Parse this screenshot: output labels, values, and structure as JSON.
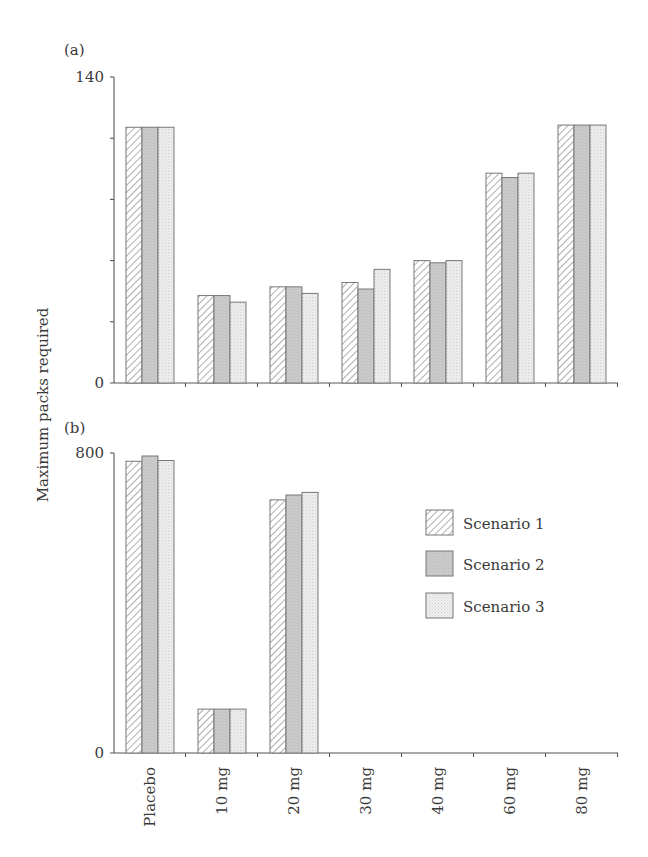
{
  "chart_data": [
    {
      "panel": "(a)",
      "type": "bar",
      "title": "",
      "xlabel": "",
      "ylabel": "Maximum packs required",
      "ylim": [
        0,
        140
      ],
      "yticks": [
        0,
        28,
        56,
        84,
        112,
        140
      ],
      "ytick_labels": [
        "0",
        "",
        "",
        "",
        "",
        "140"
      ],
      "grid": false,
      "categories": [
        "Placebo",
        "10 mg",
        "20 mg",
        "30 mg",
        "40 mg",
        "60 mg",
        "80 mg"
      ],
      "series": [
        {
          "name": "Scenario 1",
          "values": [
            117,
            40,
            44,
            46,
            56,
            96,
            118
          ]
        },
        {
          "name": "Scenario 2",
          "values": [
            117,
            40,
            44,
            43,
            55,
            94,
            118
          ]
        },
        {
          "name": "Scenario 3",
          "values": [
            117,
            37,
            41,
            52,
            56,
            96,
            118
          ]
        }
      ]
    },
    {
      "panel": "(b)",
      "type": "bar",
      "title": "",
      "xlabel": "",
      "ylabel": "Maximum packs required",
      "ylim": [
        0,
        800
      ],
      "yticks": [
        0,
        800
      ],
      "ytick_labels": [
        "0",
        "800"
      ],
      "grid": false,
      "categories": [
        "Placebo",
        "10 mg",
        "20 mg",
        "30 mg",
        "40 mg",
        "60 mg",
        "80 mg"
      ],
      "series": [
        {
          "name": "Scenario 1",
          "values": [
            778,
            117,
            675,
            0,
            0,
            0,
            0
          ]
        },
        {
          "name": "Scenario 2",
          "values": [
            792,
            117,
            688,
            0,
            0,
            0,
            0
          ]
        },
        {
          "name": "Scenario 3",
          "values": [
            780,
            117,
            695,
            0,
            0,
            0,
            0
          ]
        }
      ]
    }
  ],
  "labels": {
    "panel_a": "(a)",
    "panel_b": "(b)",
    "ylabel": "Maximum packs required"
  },
  "legend": {
    "position": "right, inside panel (b)",
    "items": [
      {
        "name": "Scenario 1",
        "pattern": "hatch"
      },
      {
        "name": "Scenario 2",
        "pattern": "solid-gray"
      },
      {
        "name": "Scenario 3",
        "pattern": "light-dots"
      }
    ]
  },
  "colors": {
    "axis": "#555555",
    "text": "#3a3a3a",
    "bar_outline": "#777777",
    "hatch_line": "#9a9a9a",
    "scenario2_fill": "#c9c9c9",
    "scenario3_fill": "#eeeeee",
    "scenario3_dot": "#c4c4c4"
  }
}
